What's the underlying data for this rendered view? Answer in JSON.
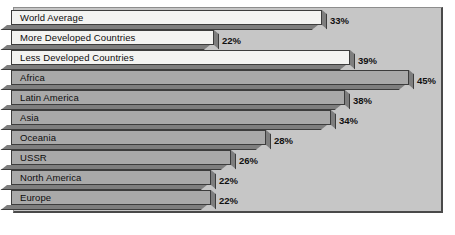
{
  "chart_data": {
    "type": "bar",
    "orientation": "horizontal",
    "title": "",
    "subtitle": "",
    "xlabel": "",
    "ylabel": "",
    "xlim": [
      0,
      50
    ],
    "grid": false,
    "legend": null,
    "value_suffix": "%",
    "categories": [
      "World Average",
      "More Developed Countries",
      "Less Developed Countries",
      "Africa",
      "Latin America",
      "Asia",
      "Oceania",
      "USSR",
      "North America",
      "Europe"
    ],
    "values": [
      33,
      22,
      39,
      45,
      38,
      34,
      28,
      26,
      22,
      22
    ],
    "value_labels": [
      "33%",
      "22%",
      "39%",
      "45%",
      "38%",
      "34%",
      "28%",
      "26%",
      "22%",
      "22%"
    ],
    "bars": [
      {
        "label": "World Average",
        "value": 33,
        "value_label": "33%",
        "shade": "light",
        "bar_end_px": 322,
        "label_x_px": 330
      },
      {
        "label": "More Developed Countries",
        "value": 22,
        "value_label": "22%",
        "shade": "light",
        "bar_end_px": 214,
        "label_x_px": 222
      },
      {
        "label": "Less Developed Countries",
        "value": 39,
        "value_label": "39%",
        "shade": "light",
        "bar_end_px": 350,
        "label_x_px": 358
      },
      {
        "label": "Africa",
        "value": 45,
        "value_label": "45%",
        "shade": "medium",
        "bar_end_px": 409,
        "label_x_px": 417
      },
      {
        "label": "Latin America",
        "value": 38,
        "value_label": "38%",
        "shade": "medium",
        "bar_end_px": 345,
        "label_x_px": 353
      },
      {
        "label": "Asia",
        "value": 34,
        "value_label": "34%",
        "shade": "medium",
        "bar_end_px": 331,
        "label_x_px": 339
      },
      {
        "label": "Oceania",
        "value": 28,
        "value_label": "28%",
        "shade": "medium",
        "bar_end_px": 266,
        "label_x_px": 274
      },
      {
        "label": "USSR",
        "value": 26,
        "value_label": "26%",
        "shade": "medium",
        "bar_end_px": 231,
        "label_x_px": 239
      },
      {
        "label": "North America",
        "value": 22,
        "value_label": "22%",
        "shade": "medium",
        "bar_end_px": 211,
        "label_x_px": 219
      },
      {
        "label": "Europe",
        "value": 22,
        "value_label": "22%",
        "shade": "medium",
        "bar_end_px": 211,
        "label_x_px": 219
      }
    ],
    "colors": {
      "plot_background": "#c6c6c6",
      "bar_light": "#f3f3f1",
      "bar_medium": "#a9a9a9",
      "bar_shadow": "#7e7e7e",
      "bar_outline": "#3c3c3c",
      "text": "#0d0d0d",
      "page_background": "#ffffff"
    }
  }
}
